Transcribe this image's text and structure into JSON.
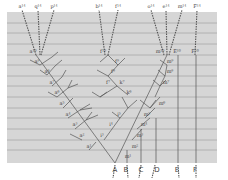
{
  "diagram": {
    "panel": {
      "x": 7,
      "y": 12,
      "w": 210,
      "h": 151,
      "fill": "#d6d6d6",
      "line_color": "#a8a8a8"
    },
    "gridlines_y": [
      23,
      33,
      44,
      55,
      65,
      76,
      86,
      97,
      108,
      118,
      129,
      140,
      150
    ],
    "top_labels": [
      {
        "text": "a¹⁴",
        "x": 22,
        "y": 8
      },
      {
        "text": "q¹⁴",
        "x": 38,
        "y": 8
      },
      {
        "text": "p¹⁴",
        "x": 54,
        "y": 8
      },
      {
        "text": "b¹⁴",
        "x": 99,
        "y": 8
      },
      {
        "text": "f¹⁴",
        "x": 118,
        "y": 8
      },
      {
        "text": "o¹⁴",
        "x": 151,
        "y": 8
      },
      {
        "text": "e¹⁴",
        "x": 166,
        "y": 8
      },
      {
        "text": "m¹⁴",
        "x": 182,
        "y": 8
      },
      {
        "text": "F¹⁴",
        "x": 197,
        "y": 8
      }
    ],
    "level10_labels": [
      {
        "text": "a¹⁰",
        "x": 33,
        "y": 53
      },
      {
        "text": "f¹⁰",
        "x": 103,
        "y": 53
      },
      {
        "text": "m¹⁰",
        "x": 160,
        "y": 53
      },
      {
        "text": "E¹⁰",
        "x": 177,
        "y": 53
      },
      {
        "text": "F¹⁰",
        "x": 195,
        "y": 53
      }
    ],
    "branch_labels": [
      {
        "text": "a⁹",
        "x": 37,
        "y": 63
      },
      {
        "text": "a⁸",
        "x": 47,
        "y": 73
      },
      {
        "text": "a⁷",
        "x": 52,
        "y": 84
      },
      {
        "text": "a⁶",
        "x": 57,
        "y": 94
      },
      {
        "text": "a⁵",
        "x": 62,
        "y": 105
      },
      {
        "text": "a⁴",
        "x": 68,
        "y": 116
      },
      {
        "text": "a³",
        "x": 75,
        "y": 126
      },
      {
        "text": "a²",
        "x": 82,
        "y": 137
      },
      {
        "text": "a¹",
        "x": 89,
        "y": 148
      },
      {
        "text": "f⁹",
        "x": 117,
        "y": 63
      },
      {
        "text": "f⁸",
        "x": 113,
        "y": 73
      },
      {
        "text": "f⁷",
        "x": 108,
        "y": 84
      },
      {
        "text": "k⁷",
        "x": 122,
        "y": 84
      },
      {
        "text": "k⁶",
        "x": 129,
        "y": 94
      },
      {
        "text": "i⁵",
        "x": 119,
        "y": 116
      },
      {
        "text": "i⁴",
        "x": 111,
        "y": 126
      },
      {
        "text": "i³",
        "x": 102,
        "y": 137
      },
      {
        "text": "m⁹",
        "x": 170,
        "y": 63
      },
      {
        "text": "m⁸",
        "x": 170,
        "y": 73
      },
      {
        "text": "m⁷",
        "x": 166,
        "y": 84
      },
      {
        "text": "m⁶",
        "x": 162,
        "y": 105
      },
      {
        "text": "m⁵",
        "x": 147,
        "y": 116
      },
      {
        "text": "m⁴",
        "x": 144,
        "y": 126
      },
      {
        "text": "m³",
        "x": 140,
        "y": 137
      },
      {
        "text": "m²",
        "x": 135,
        "y": 148
      },
      {
        "text": "m¹",
        "x": 128,
        "y": 158
      }
    ],
    "species_labels": [
      {
        "text": "A",
        "x": 115,
        "y": 172
      },
      {
        "text": "B",
        "x": 126,
        "y": 172
      },
      {
        "text": "C",
        "x": 141,
        "y": 172
      },
      {
        "text": "D",
        "x": 157,
        "y": 172
      },
      {
        "text": "E",
        "x": 177,
        "y": 172
      },
      {
        "text": "F",
        "x": 195,
        "y": 172
      }
    ],
    "dashed_lines": [
      [
        36,
        55,
        22,
        10
      ],
      [
        40,
        55,
        38,
        10
      ],
      [
        41,
        55,
        54,
        10
      ],
      [
        105,
        55,
        99,
        10
      ],
      [
        108,
        55,
        118,
        10
      ],
      [
        164,
        55,
        151,
        10
      ],
      [
        167,
        55,
        166,
        10
      ],
      [
        169,
        55,
        182,
        10
      ],
      [
        195,
        55,
        197,
        10
      ],
      [
        115,
        165,
        113,
        178
      ],
      [
        127,
        165,
        128,
        178
      ],
      [
        141,
        165,
        139,
        178
      ],
      [
        155,
        165,
        152,
        178
      ],
      [
        178,
        165,
        179,
        178
      ],
      [
        196,
        165,
        196,
        178
      ]
    ],
    "solid_lines": [
      [
        115,
        163,
        36,
        55
      ],
      [
        115,
        163,
        167,
        55
      ],
      [
        40,
        65,
        52,
        57
      ],
      [
        40,
        65,
        30,
        60
      ],
      [
        47,
        75,
        55,
        66
      ],
      [
        47,
        75,
        40,
        70
      ],
      [
        52,
        86,
        62,
        77
      ],
      [
        57,
        97,
        68,
        88
      ],
      [
        57,
        97,
        48,
        92
      ],
      [
        63,
        108,
        73,
        98
      ],
      [
        68,
        118,
        80,
        110
      ],
      [
        75,
        129,
        86,
        120
      ],
      [
        82,
        140,
        70,
        134
      ],
      [
        89,
        150,
        96,
        142
      ],
      [
        86,
        120,
        92,
        112
      ],
      [
        86,
        120,
        98,
        115
      ],
      [
        80,
        110,
        90,
        104
      ],
      [
        80,
        110,
        92,
        108
      ],
      [
        68,
        88,
        72,
        80
      ],
      [
        68,
        88,
        78,
        84
      ],
      [
        62,
        77,
        66,
        70
      ],
      [
        55,
        66,
        62,
        60
      ],
      [
        52,
        57,
        58,
        52
      ],
      [
        108,
        55,
        118,
        65
      ],
      [
        118,
        65,
        108,
        76
      ],
      [
        108,
        76,
        117,
        86
      ],
      [
        117,
        86,
        100,
        97
      ],
      [
        117,
        86,
        128,
        95
      ],
      [
        108,
        76,
        97,
        70
      ],
      [
        118,
        65,
        125,
        58
      ],
      [
        108,
        55,
        100,
        62
      ],
      [
        100,
        97,
        92,
        92
      ],
      [
        100,
        97,
        107,
        92
      ],
      [
        104,
        140,
        120,
        118
      ],
      [
        120,
        118,
        128,
        108
      ],
      [
        128,
        108,
        122,
        97
      ],
      [
        128,
        108,
        137,
        100
      ],
      [
        120,
        118,
        112,
        112
      ],
      [
        132,
        140,
        142,
        129
      ],
      [
        137,
        129,
        150,
        118
      ],
      [
        145,
        118,
        155,
        108
      ],
      [
        150,
        108,
        160,
        97
      ],
      [
        155,
        97,
        160,
        86
      ],
      [
        160,
        86,
        165,
        76
      ],
      [
        165,
        76,
        167,
        65
      ],
      [
        150,
        108,
        140,
        100
      ],
      [
        150,
        108,
        156,
        100
      ],
      [
        160,
        86,
        153,
        80
      ],
      [
        160,
        86,
        166,
        80
      ],
      [
        165,
        76,
        158,
        70
      ],
      [
        167,
        65,
        160,
        60
      ],
      [
        127,
        163,
        127,
        150
      ],
      [
        141,
        163,
        141,
        129
      ],
      [
        156,
        163,
        156,
        118
      ],
      [
        178,
        163,
        178,
        55
      ],
      [
        196,
        163,
        196,
        55
      ]
    ]
  }
}
